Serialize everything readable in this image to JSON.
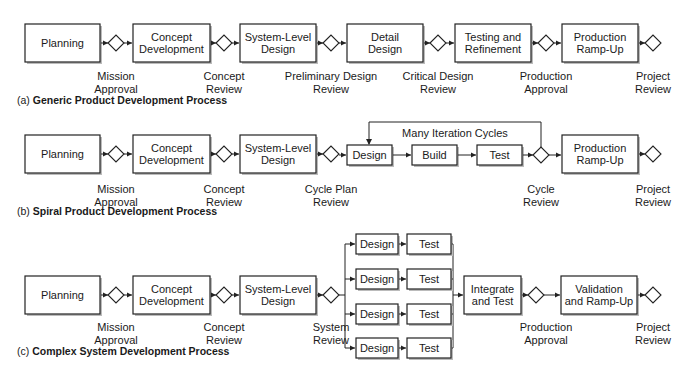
{
  "diagrams": {
    "a": {
      "caption_letter": "(a)",
      "caption_title": "Generic Product Development Process",
      "boxes": [
        [
          "Planning"
        ],
        [
          "Concept",
          "Development"
        ],
        [
          "System-Level",
          "Design"
        ],
        [
          "Detail",
          "Design"
        ],
        [
          "Testing and",
          "Refinement"
        ],
        [
          "Production",
          "Ramp-Up"
        ]
      ],
      "gates": [
        [
          "Mission",
          "Approval"
        ],
        [
          "Concept",
          "Review"
        ],
        [
          "Preliminary Design",
          "Review"
        ],
        [
          "Critical Design",
          "Review"
        ],
        [
          "Production",
          "Approval"
        ],
        [
          "Project",
          "Review"
        ]
      ]
    },
    "b": {
      "caption_letter": "(b)",
      "caption_title": "Spiral Product Development Process",
      "boxes": [
        [
          "Planning"
        ],
        [
          "Concept",
          "Development"
        ],
        [
          "System-Level",
          "Design"
        ],
        [
          "Design"
        ],
        [
          "Build"
        ],
        [
          "Test"
        ],
        [
          "Production",
          "Ramp-Up"
        ]
      ],
      "loop_label": "Many Iteration Cycles",
      "gates": [
        [
          "Mission",
          "Approval"
        ],
        [
          "Concept",
          "Review"
        ],
        [
          "Cycle Plan",
          "Review"
        ],
        [
          "Cycle",
          "Review"
        ],
        [
          "Project",
          "Review"
        ]
      ]
    },
    "c": {
      "caption_letter": "(c)",
      "caption_title": "Complex System Development Process",
      "boxes": [
        [
          "Planning"
        ],
        [
          "Concept",
          "Development"
        ],
        [
          "System-Level",
          "Design"
        ],
        [
          "Integrate",
          "and Test"
        ],
        [
          "Validation",
          "and Ramp-Up"
        ]
      ],
      "parallel": {
        "design": "Design",
        "test": "Test",
        "count": 4
      },
      "gates": [
        [
          "Mission",
          "Approval"
        ],
        [
          "Concept",
          "Review"
        ],
        [
          "System",
          "Review"
        ],
        [
          "Production",
          "Approval"
        ],
        [
          "Project",
          "Review"
        ]
      ]
    }
  }
}
